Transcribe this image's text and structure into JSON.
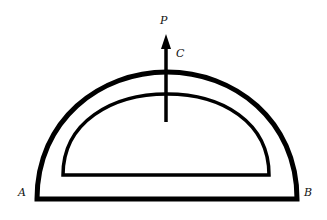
{
  "diagram": {
    "labels": {
      "force": "P",
      "top_point": "C",
      "left_corner": "A",
      "right_corner": "B"
    },
    "colors": {
      "stroke": "#000000",
      "background": "#ffffff"
    }
  }
}
